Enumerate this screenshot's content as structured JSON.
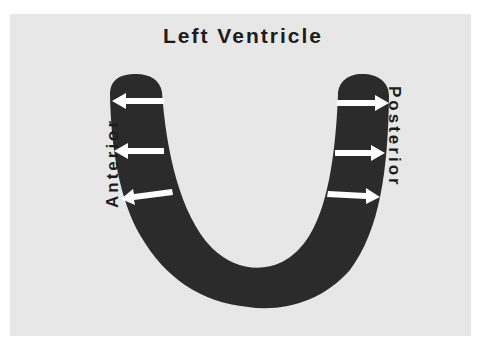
{
  "title": "Left Ventricle",
  "labels": {
    "anterior": "Anterior",
    "posterior": "Posterior"
  },
  "colors": {
    "background": "#e7e7e7",
    "wall": "#2b2b2b",
    "arrow": "#ffffff",
    "text": "#1c1c1c"
  },
  "arrows": {
    "anterior": [
      {
        "direction": "outward-left",
        "y": 101
      },
      {
        "direction": "outward-left",
        "y": 151
      },
      {
        "direction": "outward-left",
        "y": 195
      }
    ],
    "posterior": [
      {
        "direction": "outward-right",
        "y": 103
      },
      {
        "direction": "outward-right",
        "y": 153
      },
      {
        "direction": "outward-right",
        "y": 196
      }
    ]
  }
}
